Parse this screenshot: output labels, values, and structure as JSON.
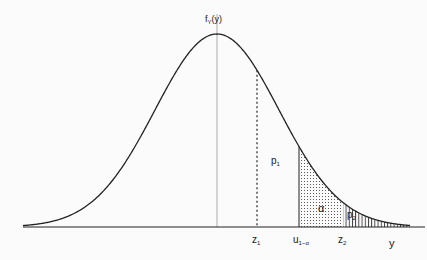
{
  "figure": {
    "y_axis_label": "f",
    "y_axis_label_sub": "Y",
    "y_axis_label_arg": "(y)",
    "x_axis_label": "y",
    "labels": {
      "z1": "z",
      "z1_sub": "1",
      "u": "u",
      "u_sub": "1−α",
      "z2": "z",
      "z2_sub": "2",
      "p1": "p",
      "p1_sub": "1",
      "p2": "p",
      "p2_sub": "2",
      "alpha": "α"
    }
  },
  "chart_data": {
    "type": "area",
    "xlabel": "y",
    "ylabel": "f_Y(y)",
    "markers": [
      "z1",
      "u_{1-α}",
      "z2"
    ],
    "regions": [
      {
        "name": "p1",
        "from": "z1",
        "to": "∞",
        "style": "unshaded label"
      },
      {
        "name": "α",
        "from": "u_{1-α}",
        "to": "z2",
        "style": "dotted"
      },
      {
        "name": "p2",
        "from": "z2",
        "to": "∞",
        "style": "vertical hatch"
      }
    ]
  }
}
